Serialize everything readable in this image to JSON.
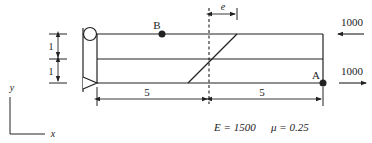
{
  "diagram": {
    "type": "structural-mechanics-plate",
    "points": [
      {
        "id": "B",
        "label": "B"
      },
      {
        "id": "A",
        "label": "A"
      }
    ],
    "dimensions": {
      "height_top": "1",
      "height_bottom": "1",
      "width_left": "5",
      "width_right": "5",
      "offset": "e"
    },
    "loads": {
      "top_load": "1000",
      "bottom_load": "1000"
    },
    "axes": {
      "x": "x",
      "y": "y"
    },
    "material": {
      "E_label": "E = 1500",
      "mu_label": "μ = 0.25"
    },
    "colors": {
      "line": "#222222",
      "background": "#ffffff"
    }
  }
}
